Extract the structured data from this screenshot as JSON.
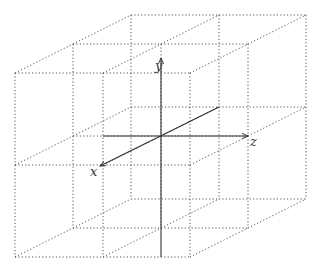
{
  "diagram": {
    "title": "",
    "axes": [
      {
        "name": "y",
        "label": "y",
        "direction": "up"
      },
      {
        "name": "z",
        "label": "z",
        "direction": "right"
      },
      {
        "name": "x",
        "label": "x",
        "direction": "front-left (oblique)"
      }
    ],
    "grid": {
      "cells_per_axis": 2,
      "line_style": "dotted",
      "line_color": "#555555"
    },
    "axis_color": "#333333",
    "geometry": {
      "front_x": [
        15,
        103,
        190
      ],
      "front_y": [
        73,
        165,
        257
      ],
      "depth_step": [
        58,
        -29
      ],
      "origin": [
        161,
        136
      ],
      "y_axis": {
        "from": [
          161,
          257
        ],
        "to": [
          161,
          58
        ]
      },
      "z_axis": {
        "from": [
          103,
          136
        ],
        "to": [
          248,
          136
        ]
      },
      "x_axis": {
        "from": [
          219,
          107
        ],
        "to": [
          100,
          166
        ]
      }
    }
  }
}
